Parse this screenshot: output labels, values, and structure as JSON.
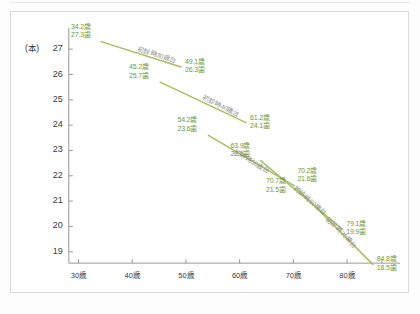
{
  "chart_data": {
    "type": "line",
    "title": "",
    "xlabel": "",
    "ylabel": "(本)",
    "xlim": [
      26,
      88
    ],
    "ylim": [
      18.2,
      27.6
    ],
    "grid": false,
    "legend": "inline-on-line",
    "x_ticks": [
      "30歳",
      "40歳",
      "50歳",
      "60歳",
      "70歳",
      "80歳"
    ],
    "x_tick_values": [
      30,
      40,
      50,
      60,
      70,
      80
    ],
    "y_ticks": [
      "19",
      "20",
      "21",
      "22",
      "23",
      "24",
      "25",
      "26",
      "27"
    ],
    "y_tick_values": [
      19,
      20,
      21,
      22,
      23,
      24,
      25,
      26,
      27
    ],
    "unit_label": "(本)",
    "series": [
      {
        "name": "初診時30歳台",
        "points": [
          {
            "x": 34.2,
            "y": 27.3,
            "label_age": "34.2歳",
            "label_teeth": "27.3歯"
          },
          {
            "x": 49.1,
            "y": 26.3,
            "label_age": "49.1歳",
            "label_teeth": "26.3歯"
          }
        ]
      },
      {
        "name": "初診時40歳台",
        "points": [
          {
            "x": 45.2,
            "y": 25.7,
            "label_age": "45.2歳",
            "label_teeth": "25.7歯"
          },
          {
            "x": 61.2,
            "y": 24.1,
            "label_age": "61.2歳",
            "label_teeth": "24.1歯"
          }
        ]
      },
      {
        "name": "初診時50歳台",
        "points": [
          {
            "x": 54.2,
            "y": 23.6,
            "label_age": "54.2歳",
            "label_teeth": "23.6歯"
          },
          {
            "x": 70.2,
            "y": 21.6,
            "label_age": "70.2歳",
            "label_teeth": "21.6歯"
          }
        ]
      },
      {
        "name": "初診時60歳台",
        "points": [
          {
            "x": 63.9,
            "y": 22.6,
            "label_age": "63.9歳",
            "label_teeth": "22.6歯"
          },
          {
            "x": 79.1,
            "y": 19.9,
            "label_age": "79.1歳",
            "label_teeth": "19.9歯"
          }
        ]
      },
      {
        "name": "初診時70歳台",
        "points": [
          {
            "x": 70.7,
            "y": 21.5,
            "label_age": "70.7歳",
            "label_teeth": "21.5歯"
          },
          {
            "x": 84.8,
            "y": 18.5,
            "label_age": "84.8歳",
            "label_teeth": "18.5歯"
          }
        ]
      }
    ],
    "colors": {
      "line": "#a8bf5e",
      "point_label": "#6f9a3a",
      "series_label": "#8a8a8a",
      "axis": "#8c8c8c",
      "tick_text": "#3a3a3a",
      "frame": "#d9dada",
      "background": "#ffffff"
    }
  },
  "axis": {
    "unit": "(本)",
    "y_ticks": [
      "27",
      "26",
      "25",
      "24",
      "23",
      "22",
      "21",
      "20",
      "19"
    ],
    "x_ticks": [
      "30歳",
      "40歳",
      "50歳",
      "60歳",
      "70歳",
      "80歳"
    ]
  },
  "point_labels": [
    {
      "age": "34.2歳",
      "teeth": "27.3歯"
    },
    {
      "age": "49.1歳",
      "teeth": "26.3歯"
    },
    {
      "age": "45.2歳",
      "teeth": "25.7歯"
    },
    {
      "age": "61.2歳",
      "teeth": "24.1歯"
    },
    {
      "age": "54.2歳",
      "teeth": "23.6歯"
    },
    {
      "age": "70.2歳",
      "teeth": "21.6歯"
    },
    {
      "age": "63.9歳",
      "teeth": "22.6歯"
    },
    {
      "age": "79.1歳",
      "teeth": "19.9歯"
    },
    {
      "age": "70.7歳",
      "teeth": "21.5歯"
    },
    {
      "age": "84.8歳",
      "teeth": "18.5歯"
    }
  ],
  "series_labels": [
    "初診時30歳台",
    "初診時40歳台",
    "初診時50歳台",
    "初診時60歳台",
    "初診時70歳台"
  ]
}
